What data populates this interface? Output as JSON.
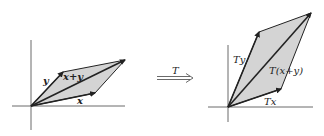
{
  "figure": {
    "left_panel": {
      "labels": {
        "x": "x",
        "y": "y",
        "sum": "x+y"
      },
      "origin": [
        31,
        106
      ],
      "vector_x_tip": [
        95,
        93
      ],
      "vector_y_tip": [
        63,
        72
      ],
      "vector_sum_tip": [
        125,
        60
      ]
    },
    "transform": {
      "label": "T"
    },
    "right_panel": {
      "labels": {
        "tx": "Tx",
        "ty": "Ty",
        "tsum": "T(x+y)"
      },
      "origin": [
        228,
        107
      ],
      "vector_tx_tip": [
        281,
        89
      ],
      "vector_ty_tip": [
        259,
        32
      ],
      "vector_tsum_tip": [
        311,
        13
      ]
    },
    "colors": {
      "fill": "#d4d4d4",
      "stroke": "#222222",
      "axis": "#444444"
    }
  }
}
